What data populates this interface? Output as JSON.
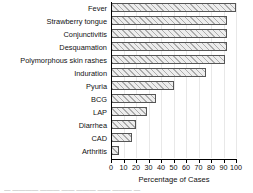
{
  "chart_data": {
    "type": "bar",
    "orientation": "horizontal",
    "title": "",
    "xlabel": "Percentage of Cases",
    "ylabel": "",
    "xlim": [
      0,
      100
    ],
    "xticks": [
      0,
      10,
      20,
      30,
      40,
      50,
      60,
      70,
      80,
      90,
      100
    ],
    "grid": "vertical",
    "legend": "none",
    "categories": [
      "Fever",
      "Strawberry tongue",
      "Conjunctivitis",
      "Desquamation",
      "Polymorphous skin rashes",
      "Induration",
      "Pyuria",
      "BCG",
      "LAP",
      "Diarrhea",
      "CAD",
      "Arthritis"
    ],
    "values": [
      100,
      93,
      93,
      93,
      91,
      76,
      50,
      36,
      29,
      20,
      17,
      6
    ],
    "bar_fill": "#ededed",
    "bar_edge": "#555555",
    "bar_hatch": "diagonal"
  },
  "axis": {
    "x_title": "Percentage of Cases",
    "tick_labels": [
      "0",
      "10",
      "20",
      "30",
      "40",
      "50",
      "60",
      "70",
      "80",
      "90",
      "100"
    ]
  },
  "caption": {
    "text": "—  ————  ———  ——  ———  ——  ———  —"
  }
}
